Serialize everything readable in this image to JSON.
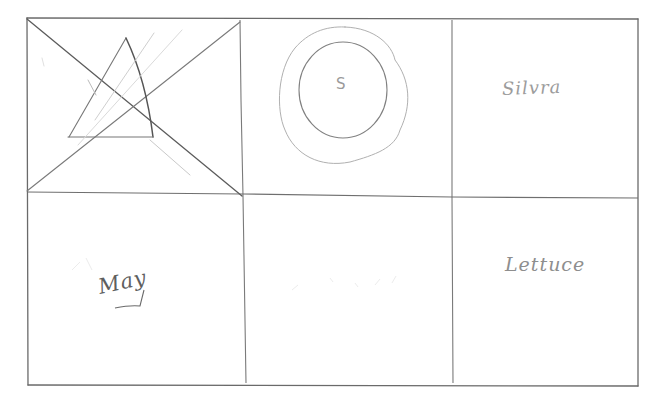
{
  "sketch": {
    "type": "hand-drawn wireframe",
    "grid": {
      "columns": 3,
      "rows": 2
    },
    "cells": [
      {
        "id": "r1c1",
        "content": "image-placeholder",
        "icon": "crossed-box-with-triangle-icon",
        "label": ""
      },
      {
        "id": "r1c2",
        "content": "circle-logo",
        "icon": "concentric-circles-icon",
        "label": "S"
      },
      {
        "id": "r1c3",
        "content": "text",
        "label": "Silvra"
      },
      {
        "id": "r2c1",
        "content": "text",
        "label": "May"
      },
      {
        "id": "r2c2",
        "content": "empty",
        "label": ""
      },
      {
        "id": "r2c3",
        "content": "text",
        "label": "Lettuce"
      }
    ],
    "colors": {
      "pencil_dark": "#5a5a5a",
      "pencil_mid": "#7a7a7a",
      "pencil_light": "#b5b5b5",
      "paper": "#ffffff"
    }
  }
}
